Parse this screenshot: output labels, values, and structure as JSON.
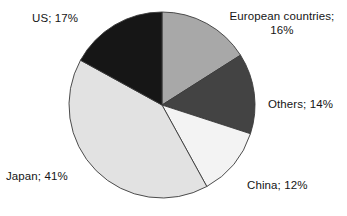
{
  "chart_data": {
    "type": "pie",
    "title": "",
    "subtitle": "",
    "xlabel": "",
    "ylabel": "",
    "legend_position": "none",
    "grid": false,
    "label_format": "{name}; {value}%",
    "start_angle_deg": 0,
    "direction": "clockwise",
    "categories": [
      "European countries",
      "Others",
      "China",
      "Japan",
      "US"
    ],
    "values": [
      16,
      14,
      12,
      41,
      17
    ],
    "total": 100,
    "units": "percent",
    "slices": [
      {
        "name": "European countries",
        "value": 16,
        "label": "European countries;",
        "label_line2": "16%",
        "color": "#a8a8a8",
        "outline": "#3a3a3a"
      },
      {
        "name": "Others",
        "value": 14,
        "label": "Others; 14%",
        "color": "#434343",
        "outline": "#3a3a3a"
      },
      {
        "name": "China",
        "value": 12,
        "label": "China; 12%",
        "color": "#f3f3f3",
        "outline": "#3a3a3a"
      },
      {
        "name": "Japan",
        "value": 41,
        "label": "Japan; 41%",
        "color": "#e2e2e2",
        "outline": "#3a3a3a"
      },
      {
        "name": "US",
        "value": 17,
        "label": "US; 17%",
        "color": "#161616",
        "outline": "#3a3a3a"
      }
    ]
  },
  "geometry": {
    "center_x": 162,
    "center_y": 105,
    "radius": 93
  },
  "colors": {
    "background": "#ffffff",
    "text": "#151515",
    "slice_outline": "#3a3a3a"
  }
}
